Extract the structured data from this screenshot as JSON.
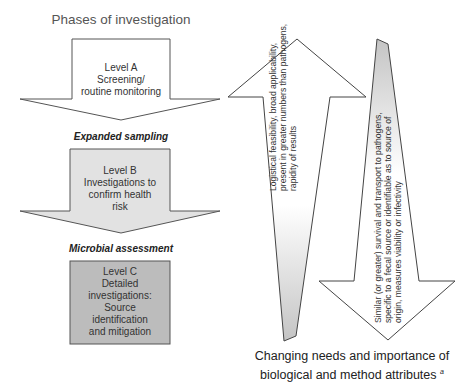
{
  "title": "Phases of investigation",
  "phases": [
    {
      "label": "Level A",
      "lines": [
        "Level A",
        "Screening/",
        "routine monitoring"
      ],
      "fill": "#ffffff"
    },
    {
      "connector": "Expanded sampling"
    },
    {
      "label": "Level B",
      "lines": [
        "Level B",
        "Investigations to",
        "confirm health",
        "risk"
      ],
      "fill": "#e2e2e2"
    },
    {
      "connector": "Microbial assessment"
    },
    {
      "label": "Level C",
      "lines": [
        "Level C",
        "Detailed",
        "investigations:",
        "Source",
        "identification",
        "and mitigation"
      ],
      "fill": "#bcbcbc"
    }
  ],
  "up_arrow": {
    "lines": [
      "Logistical feasibility, broad applicability,",
      "present in greater numbers than pathogens,",
      "rapidity of results"
    ],
    "gradient": [
      "#ffffff",
      "#c4c4c4"
    ]
  },
  "down_arrow": {
    "lines": [
      "Similar (or greater) survival and transport to pathogens,",
      "specific to a fecal source or identifiable as to source of",
      "origin, measures viability or infectivity"
    ],
    "gradient": [
      "#c4c4c4",
      "#ffffff"
    ]
  },
  "caption": {
    "line1": "Changing needs and importance of",
    "line2": "biological and method attributes",
    "footnote": "a"
  }
}
